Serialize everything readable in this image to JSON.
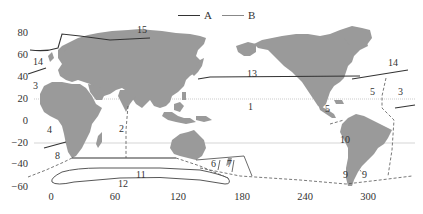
{
  "legend": {
    "items": [
      {
        "label": "A",
        "style": "solid-dark",
        "color": "#333333"
      },
      {
        "label": "B",
        "style": "solid-light",
        "color": "#888888"
      }
    ]
  },
  "axes": {
    "y_ticks": [
      "80",
      "60",
      "40",
      "20",
      "0",
      "−20",
      "−40",
      "−60"
    ],
    "x_ticks": [
      "0",
      "60",
      "120",
      "180",
      "240",
      "300"
    ]
  },
  "regions": [
    {
      "id": "1",
      "label": "1"
    },
    {
      "id": "2",
      "label": "2"
    },
    {
      "id": "3a",
      "label": "3"
    },
    {
      "id": "3b",
      "label": "3"
    },
    {
      "id": "4",
      "label": "4"
    },
    {
      "id": "5a",
      "label": "5"
    },
    {
      "id": "5b",
      "label": "5"
    },
    {
      "id": "6",
      "label": "6"
    },
    {
      "id": "7",
      "label": "7"
    },
    {
      "id": "8",
      "label": "8"
    },
    {
      "id": "9a",
      "label": "9"
    },
    {
      "id": "9b",
      "label": "9"
    },
    {
      "id": "10",
      "label": "10"
    },
    {
      "id": "11",
      "label": "11"
    },
    {
      "id": "12",
      "label": "12"
    },
    {
      "id": "13",
      "label": "13"
    },
    {
      "id": "14a",
      "label": "14"
    },
    {
      "id": "14b",
      "label": "14"
    },
    {
      "id": "15",
      "label": "15"
    }
  ],
  "colors": {
    "land": "#9a9a9a",
    "line_dark": "#333333",
    "line_light": "#999999",
    "gridline": "#bbbbbb"
  }
}
